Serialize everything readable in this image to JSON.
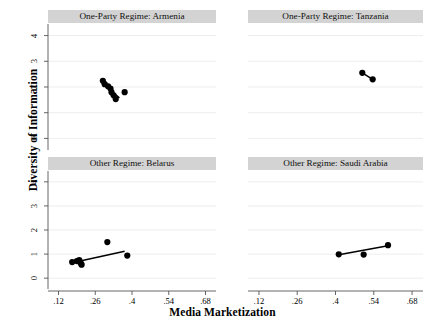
{
  "chart_data": {
    "type": "scatter",
    "title": "",
    "xlabel": "Media Marketization",
    "ylabel": "Diversity of Information",
    "xlim": [
      0.08,
      0.72
    ],
    "ylim": [
      -0.45,
      4.45
    ],
    "xticks": [
      ".12",
      ".26",
      ".4",
      ".54",
      ".68"
    ],
    "xtick_values": [
      0.12,
      0.26,
      0.4,
      0.54,
      0.68
    ],
    "yticks": [
      "0",
      "1",
      "2",
      "3",
      "4"
    ],
    "ytick_values": [
      0,
      1,
      2,
      3,
      4
    ],
    "grid": "horizontal",
    "legend": "none",
    "marker": "filled-circle",
    "marker_color": "#000000",
    "fit_line_color": "#000000",
    "panel_title_background": "#d3d3d3",
    "layout": "2x2 small-multiples",
    "panels": [
      {
        "id": "armenia",
        "title": "One-Party Regime: Armenia",
        "row": 0,
        "col": 0,
        "points": [
          {
            "x": 0.289,
            "y": 2.24
          },
          {
            "x": 0.296,
            "y": 2.11
          },
          {
            "x": 0.309,
            "y": 2.03
          },
          {
            "x": 0.318,
            "y": 1.94
          },
          {
            "x": 0.322,
            "y": 1.8
          },
          {
            "x": 0.33,
            "y": 1.68
          },
          {
            "x": 0.338,
            "y": 1.53
          },
          {
            "x": 0.372,
            "y": 1.8
          }
        ],
        "fit_line": {
          "x0": 0.286,
          "y0": 2.14,
          "x1": 0.352,
          "y1": 1.58
        },
        "slope_direction": "negative",
        "n": 8
      },
      {
        "id": "tanzania",
        "title": "One-Party Regime: Tanzania",
        "row": 0,
        "col": 1,
        "points": [
          {
            "x": 0.498,
            "y": 2.55
          },
          {
            "x": 0.536,
            "y": 2.3
          }
        ],
        "fit_line": {
          "x0": 0.498,
          "y0": 2.55,
          "x1": 0.536,
          "y1": 2.3
        },
        "slope_direction": "negative",
        "n": 2
      },
      {
        "id": "belarus",
        "title": "Other Regime: Belarus",
        "row": 1,
        "col": 0,
        "points": [
          {
            "x": 0.172,
            "y": 0.67
          },
          {
            "x": 0.19,
            "y": 0.71
          },
          {
            "x": 0.199,
            "y": 0.75
          },
          {
            "x": 0.201,
            "y": 0.68
          },
          {
            "x": 0.206,
            "y": 0.6
          },
          {
            "x": 0.208,
            "y": 0.56
          },
          {
            "x": 0.306,
            "y": 1.5
          },
          {
            "x": 0.382,
            "y": 0.94
          }
        ],
        "fit_line": {
          "x0": 0.198,
          "y0": 0.7,
          "x1": 0.372,
          "y1": 1.12
        },
        "slope_direction": "positive",
        "n": 8
      },
      {
        "id": "saudi-arabia",
        "title": "Other Regime: Saudi Arabia",
        "row": 1,
        "col": 1,
        "points": [
          {
            "x": 0.412,
            "y": 0.99
          },
          {
            "x": 0.503,
            "y": 0.98
          },
          {
            "x": 0.592,
            "y": 1.37
          }
        ],
        "fit_line": {
          "x0": 0.412,
          "y0": 0.97,
          "x1": 0.592,
          "y1": 1.35
        },
        "slope_direction": "positive",
        "n": 3
      }
    ]
  },
  "axes": {
    "ylabel": "Diversity of Information",
    "xlabel": "Media Marketization"
  }
}
